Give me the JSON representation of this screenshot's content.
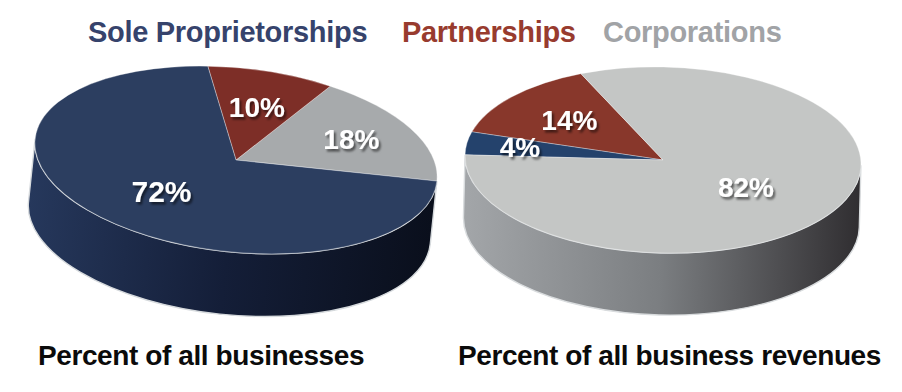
{
  "legend": {
    "items": [
      {
        "label": "Sole Proprietorships",
        "color": "#36436c"
      },
      {
        "label": "Partnerships",
        "color": "#983b2e"
      },
      {
        "label": "Corporations",
        "color": "#a1a3a6"
      }
    ]
  },
  "chart_data": [
    {
      "type": "pie",
      "title": "Percent of all businesses",
      "categories": [
        "Sole Proprietorships",
        "Partnerships",
        "Corporations"
      ],
      "values": [
        72,
        10,
        18
      ],
      "unit": "%",
      "legend_position": "top",
      "slices_ccw": [
        {
          "name": "Corporations",
          "value": 18,
          "label": "18%",
          "color": "#a7aaac",
          "label_r": 0.66,
          "label_size": 28
        },
        {
          "name": "Partnerships",
          "value": 10,
          "label": "10%",
          "color": "#7d2e27",
          "label_r": 0.6,
          "label_size": 28
        },
        {
          "name": "Sole Proprietorships",
          "value": 72,
          "label": "72%",
          "color": "#2c3e60",
          "label_r": 0.55,
          "label_size": 30
        }
      ],
      "layout": {
        "cx": 236,
        "cy": 160,
        "rx": 202,
        "ry": 92,
        "depth": 63,
        "rotate_deg": 6,
        "start_angle_deg": 0,
        "side_gradient": [
          "#26385c",
          "#141e38",
          "#0a0f1c"
        ],
        "rim_color": "#d6dadd"
      }
    },
    {
      "type": "pie",
      "title": "Percent of all business revenues",
      "categories": [
        "Sole Proprietorships",
        "Partnerships",
        "Corporations"
      ],
      "values": [
        4,
        14,
        82
      ],
      "unit": "%",
      "legend_position": "top",
      "slices_ccw": [
        {
          "name": "Partnerships",
          "value": 14,
          "label": "14%",
          "color": "#88372b",
          "label_r": 0.62,
          "label_size": 28
        },
        {
          "name": "Sole Proprietorships",
          "value": 4,
          "label": "4%",
          "color": "#24426c",
          "label_r": 0.73,
          "label_size": 28
        },
        {
          "name": "Corporations",
          "value": 82,
          "label": "82%",
          "color": "#c4c6c5",
          "label_r": 0.5,
          "label_size": 28
        }
      ],
      "layout": {
        "cx": 663,
        "cy": 160,
        "rx": 198,
        "ry": 93,
        "depth": 62,
        "rotate_deg": 1.5,
        "start_angle_deg": 115.2,
        "side_gradient": [
          "#a3a6a9",
          "#7b7e81",
          "#302e31"
        ],
        "rim_color": "#d9dcde"
      }
    }
  ],
  "label_text_color": "#ffffff"
}
